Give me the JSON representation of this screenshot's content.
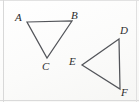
{
  "figure": {
    "background_color": "#fdfdfc",
    "stroke_color": "#53555a",
    "label_color": "#2c2c2e",
    "border_color": "#dcdcdc",
    "triangles": [
      {
        "name": "triangle-abc",
        "points": "27,22 72,21 47,58",
        "vertices": [
          {
            "label": "A",
            "x": 27,
            "y": 22,
            "label_x": 15,
            "label_y": 12
          },
          {
            "label": "B",
            "x": 72,
            "y": 21,
            "label_x": 71,
            "label_y": 10
          },
          {
            "label": "C",
            "x": 47,
            "y": 58,
            "label_x": 42,
            "label_y": 61
          }
        ]
      },
      {
        "name": "triangle-def",
        "points": "119,39 82,65 120,89",
        "vertices": [
          {
            "label": "D",
            "x": 119,
            "y": 39,
            "label_x": 120,
            "label_y": 25
          },
          {
            "label": "E",
            "x": 82,
            "y": 65,
            "label_x": 69,
            "label_y": 56
          },
          {
            "label": "F",
            "x": 120,
            "y": 89,
            "label_x": 121,
            "label_y": 87
          }
        ]
      }
    ]
  }
}
